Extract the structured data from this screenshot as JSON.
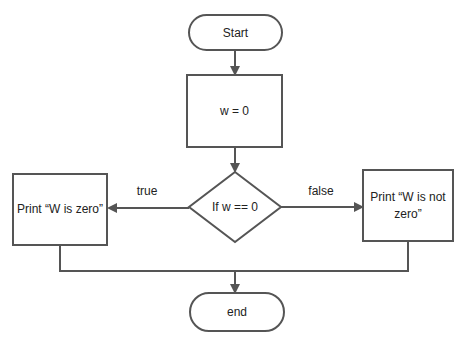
{
  "flowchart": {
    "nodes": {
      "start": {
        "type": "terminal",
        "label": "Start"
      },
      "assign": {
        "type": "process",
        "label": "w = 0"
      },
      "decision": {
        "type": "decision",
        "label": "If w == 0"
      },
      "print_zero": {
        "type": "process",
        "label": "Print “W is zero”"
      },
      "print_not_zero": {
        "type": "process",
        "label_line1": "Print “W is not",
        "label_line2": "zero”"
      },
      "end": {
        "type": "terminal",
        "label": "end"
      }
    },
    "edges": {
      "true_label": "true",
      "false_label": "false"
    },
    "colors": {
      "stroke": "#555555",
      "fill": "#ffffff",
      "text": "#222222"
    }
  }
}
